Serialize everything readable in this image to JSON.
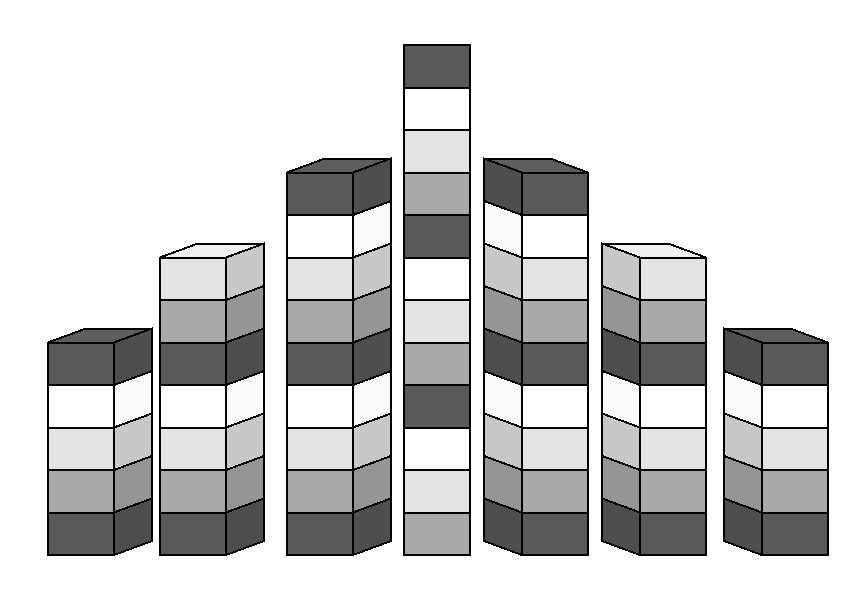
{
  "chart_data": {
    "type": "bar",
    "subtype": "stacked-bar-3d",
    "title": "",
    "subtitle": "",
    "xlabel": "",
    "ylabel": "",
    "grid": false,
    "legend": false,
    "legend_position": "none",
    "axis_visible": false,
    "tick_labels_x": [],
    "tick_labels_y": [],
    "ylim": [
      0,
      12
    ],
    "unit": "segments",
    "categories": [
      "1",
      "2",
      "3",
      "4",
      "5",
      "6",
      "7"
    ],
    "values": [
      5,
      7,
      9,
      12,
      9,
      7,
      5
    ],
    "series": [
      {
        "name": "dark",
        "color": "#595959",
        "values": [
          2,
          2,
          3,
          3,
          3,
          2,
          2
        ]
      },
      {
        "name": "white",
        "color": "#ffffff",
        "values": [
          1,
          1,
          2,
          3,
          2,
          1,
          1
        ]
      },
      {
        "name": "light",
        "color": "#e3e3e3",
        "values": [
          1,
          2,
          2,
          3,
          2,
          2,
          1
        ]
      },
      {
        "name": "medium",
        "color": "#a9a9a9",
        "values": [
          1,
          2,
          2,
          3,
          2,
          2,
          1
        ]
      }
    ],
    "segment_cycle_top_down": [
      "dark",
      "white",
      "light",
      "medium"
    ],
    "bars": [
      {
        "name": "bar-1",
        "index": 1,
        "segments": 5,
        "segment_colors": [
          "dark",
          "white",
          "light",
          "medium",
          "dark"
        ],
        "side_face": "right",
        "top_value": 5
      },
      {
        "name": "bar-2",
        "index": 2,
        "segments": 7,
        "segment_colors": [
          "light",
          "medium",
          "dark",
          "white",
          "light",
          "medium",
          "dark"
        ],
        "side_face": "right",
        "top_value": 7
      },
      {
        "name": "bar-3",
        "index": 3,
        "segments": 9,
        "segment_colors": [
          "dark",
          "white",
          "light",
          "medium",
          "dark",
          "white",
          "light",
          "medium",
          "dark"
        ],
        "side_face": "right",
        "top_value": 9
      },
      {
        "name": "bar-4",
        "index": 4,
        "segments": 12,
        "segment_colors": [
          "dark",
          "white",
          "light",
          "medium",
          "dark",
          "white",
          "light",
          "medium",
          "dark",
          "white",
          "light",
          "medium",
          "dark"
        ],
        "side_face": "none",
        "top_value": 12
      },
      {
        "name": "bar-5",
        "index": 5,
        "segments": 9,
        "segment_colors": [
          "dark",
          "white",
          "light",
          "medium",
          "dark",
          "white",
          "light",
          "medium",
          "dark"
        ],
        "side_face": "left",
        "top_value": 9
      },
      {
        "name": "bar-6",
        "index": 6,
        "segments": 7,
        "segment_colors": [
          "light",
          "medium",
          "dark",
          "white",
          "light",
          "medium",
          "dark"
        ],
        "side_face": "left",
        "top_value": 7
      },
      {
        "name": "bar-7",
        "index": 7,
        "segments": 5,
        "segment_colors": [
          "dark",
          "white",
          "light",
          "medium",
          "dark"
        ],
        "side_face": "left",
        "top_value": 5
      }
    ]
  },
  "palette": {
    "dark": "#595959",
    "white": "#ffffff",
    "light": "#e3e3e3",
    "medium": "#a9a9a9",
    "outline": "#000000",
    "background": "#ffffff",
    "side_shade_factor": "0.88",
    "top_shade_factor": "1.06"
  },
  "geometry": {
    "baseline_y": 555,
    "segment_height": 42.5,
    "bar_front_width": 66,
    "depth_dx": 38,
    "depth_dy": -14,
    "bars_x": [
      48,
      160,
      287,
      404,
      522,
      640,
      762
    ],
    "bars_top_y": [
      346,
      263,
      196,
      41,
      196,
      263,
      346
    ]
  }
}
